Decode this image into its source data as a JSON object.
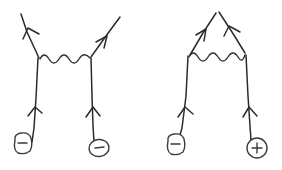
{
  "figure": {
    "title": "Feynman diagrams",
    "background_color": "#ffffff",
    "ink_color": "#2b2b2f",
    "width": 282,
    "height": 170
  },
  "diagrams": [
    {
      "id": "left-diagram",
      "name": "electron-electron-scattering",
      "label": "",
      "mediator": "photon",
      "mediator_style": "wavy",
      "mediator_orientation": "horizontal",
      "vertices": [
        {
          "name": "left-vertex",
          "x": 39,
          "y": 58
        },
        {
          "name": "right-vertex",
          "x": 91,
          "y": 57
        }
      ],
      "incoming_legs": [
        {
          "name": "incoming-electron-left",
          "charge": "-",
          "charge_glyph": "−",
          "badge_shape": "rounded-square",
          "arrow_direction": "up"
        },
        {
          "name": "incoming-electron-right",
          "charge": "-",
          "charge_glyph": "−",
          "badge_shape": "ellipse",
          "arrow_direction": "up"
        }
      ],
      "outgoing_legs": [
        {
          "name": "outgoing-electron-left",
          "arrow_direction": "up-left"
        },
        {
          "name": "outgoing-electron-right",
          "arrow_direction": "up-right"
        }
      ],
      "charge_badges": [
        {
          "name": "charge-badge-minus-left",
          "glyph": "−",
          "shape": "rounded-square",
          "x": 22,
          "y": 146
        },
        {
          "name": "charge-badge-minus-right",
          "glyph": "−",
          "shape": "ellipse",
          "x": 99,
          "y": 148
        }
      ]
    },
    {
      "id": "right-diagram",
      "name": "electron-positron-annihilation",
      "label": "",
      "mediator": "photon",
      "mediator_style": "wavy",
      "mediator_orientation": "horizontal",
      "vertices": [
        {
          "name": "left-vertex",
          "x": 189,
          "y": 55
        },
        {
          "name": "right-vertex",
          "x": 245,
          "y": 53
        },
        {
          "name": "apex-vertex",
          "x": 217,
          "y": 12
        }
      ],
      "incoming_legs": [
        {
          "name": "incoming-electron",
          "charge": "-",
          "charge_glyph": "−",
          "badge_shape": "rounded-square",
          "arrow_direction": "up"
        },
        {
          "name": "incoming-positron",
          "charge": "+",
          "charge_glyph": "+",
          "badge_shape": "circle",
          "arrow_direction": "up"
        }
      ],
      "outgoing_legs": [
        {
          "name": "outgoing-fermion-left",
          "arrow_direction": "up-right"
        },
        {
          "name": "outgoing-fermion-right",
          "arrow_direction": "up-left"
        }
      ],
      "charge_badges": [
        {
          "name": "charge-badge-minus",
          "glyph": "−",
          "shape": "rounded-square",
          "x": 175,
          "y": 147
        },
        {
          "name": "charge-badge-plus",
          "glyph": "+",
          "shape": "circle",
          "x": 257,
          "y": 148
        }
      ]
    }
  ],
  "legend": {
    "minus_symbol": "−",
    "plus_symbol": "+"
  }
}
